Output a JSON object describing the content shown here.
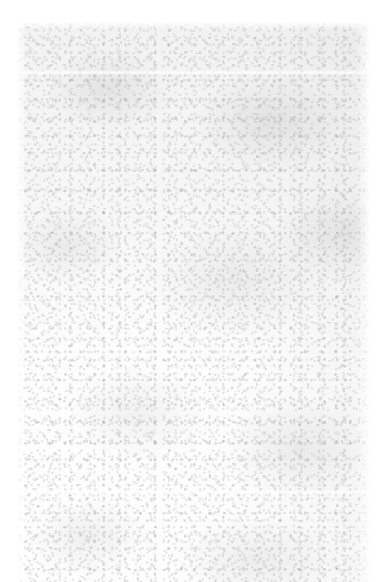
{
  "document": {
    "kind": "scanned-page",
    "orientation": "portrait",
    "content_state": "blank",
    "legible_text": "",
    "blank_note": "Blank scanned page — no legible text content.",
    "page_background": "#ffffff",
    "scan_background": "#fdfdfd",
    "speckle_color": "#969696",
    "blotch_color": "#8c8c8c",
    "margins": {
      "left": 17,
      "top": 22,
      "right": 19,
      "bottom": 0
    },
    "scan_area": {
      "left": 17,
      "top": 22,
      "width": 353,
      "height": 560
    },
    "seams": [
      {
        "name": "upper-seam",
        "y": 48
      },
      {
        "name": "lower-seam",
        "y": 468
      }
    ]
  }
}
